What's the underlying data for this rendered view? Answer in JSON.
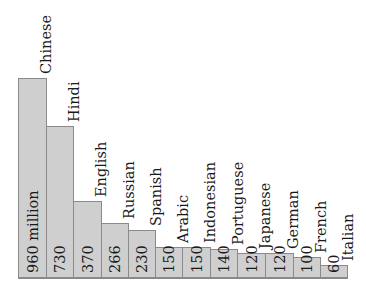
{
  "chart_data": {
    "type": "bar",
    "title": "",
    "xlabel": "",
    "ylabel": "",
    "orientation": "vertical bars with rotated labels",
    "unit": "million",
    "categories": [
      "Chinese",
      "Hindi",
      "English",
      "Russian",
      "Spanish",
      "Arabic",
      "Indonesian",
      "Portuguese",
      "Japanese",
      "German",
      "French",
      "Italian"
    ],
    "values": [
      960,
      730,
      370,
      266,
      230,
      150,
      150,
      140,
      120,
      120,
      100,
      60
    ],
    "value_labels": [
      "960 million",
      "730",
      "370",
      "266",
      "230",
      "150",
      "150",
      "140",
      "120",
      "120",
      "100",
      "60"
    ],
    "grid": false,
    "legend": null
  },
  "colors": {
    "bar_fill": "#cfcfcf",
    "bar_border": "#8a8a8a",
    "text": "#1a1a1a",
    "background": "#ffffff"
  }
}
